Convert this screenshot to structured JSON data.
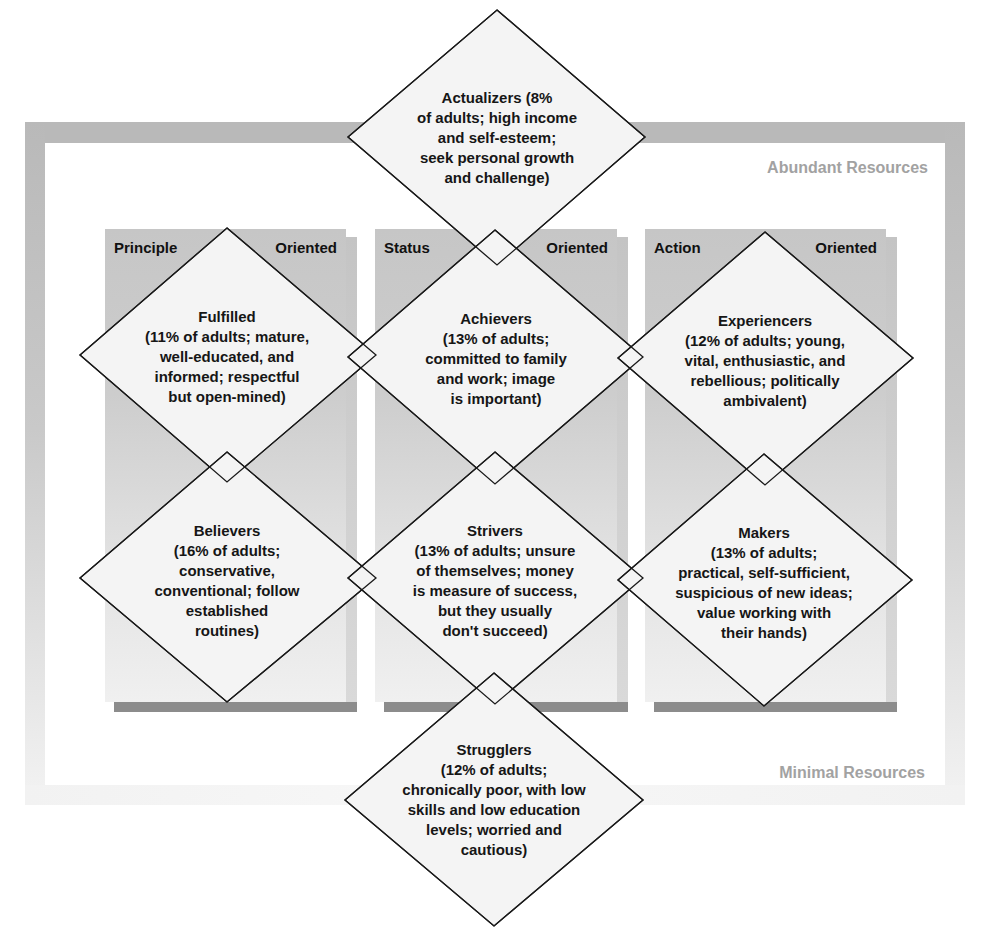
{
  "diagram": {
    "resource_axis": {
      "top_label": "Abundant Resources",
      "bottom_label": "Minimal Resources",
      "label_color": "#a2a2a2",
      "frame_color": "#b9b9b9"
    },
    "columns": [
      {
        "id": "principle",
        "heading_left": "Principle",
        "heading_right": "Oriented"
      },
      {
        "id": "status",
        "heading_left": "Status",
        "heading_right": "Oriented"
      },
      {
        "id": "action",
        "heading_left": "Action",
        "heading_right": "Oriented"
      }
    ],
    "segments": [
      {
        "id": "actualizers",
        "name": "Actualizers",
        "percent_adults": "8%",
        "position": "top-center",
        "lines": [
          "Actualizers (8%",
          "of adults; high income",
          "and self-esteem;",
          "seek personal growth",
          "and challenge)"
        ]
      },
      {
        "id": "fulfilled",
        "name": "Fulfilled",
        "percent_adults": "11%",
        "position": "principle-high",
        "lines": [
          "Fulfilled",
          "(11% of adults; mature,",
          "well-educated, and",
          "informed; respectful",
          "but open-mined)"
        ]
      },
      {
        "id": "achievers",
        "name": "Achievers",
        "percent_adults": "13%",
        "position": "status-high",
        "lines": [
          "Achievers",
          "(13% of adults;",
          "committed to family",
          "and work; image",
          "is important)"
        ]
      },
      {
        "id": "experiencers",
        "name": "Experiencers",
        "percent_adults": "12%",
        "position": "action-high",
        "lines": [
          "Experiencers",
          "(12% of adults; young,",
          "vital, enthusiastic, and",
          "rebellious; politically",
          "ambivalent)"
        ]
      },
      {
        "id": "believers",
        "name": "Believers",
        "percent_adults": "16%",
        "position": "principle-low",
        "lines": [
          "Believers",
          "(16% of adults;",
          "conservative,",
          "conventional; follow",
          "established",
          "routines)"
        ]
      },
      {
        "id": "strivers",
        "name": "Strivers",
        "percent_adults": "13%",
        "position": "status-low",
        "lines": [
          "Strivers",
          "(13% of adults; unsure",
          "of themselves; money",
          "is measure of success,",
          "but they usually",
          "don't succeed)"
        ]
      },
      {
        "id": "makers",
        "name": "Makers",
        "percent_adults": "13%",
        "position": "action-low",
        "lines": [
          "Makers",
          "(13% of adults;",
          "practical, self-sufficient,",
          "suspicious of new ideas;",
          "value working with",
          "their hands)"
        ]
      },
      {
        "id": "strugglers",
        "name": "Strugglers",
        "percent_adults": "12%",
        "position": "bottom-center",
        "lines": [
          "Strugglers",
          "(12% of adults;",
          "chronically poor, with low",
          "skills and low education",
          "levels; worried and",
          "cautious)"
        ]
      }
    ]
  }
}
